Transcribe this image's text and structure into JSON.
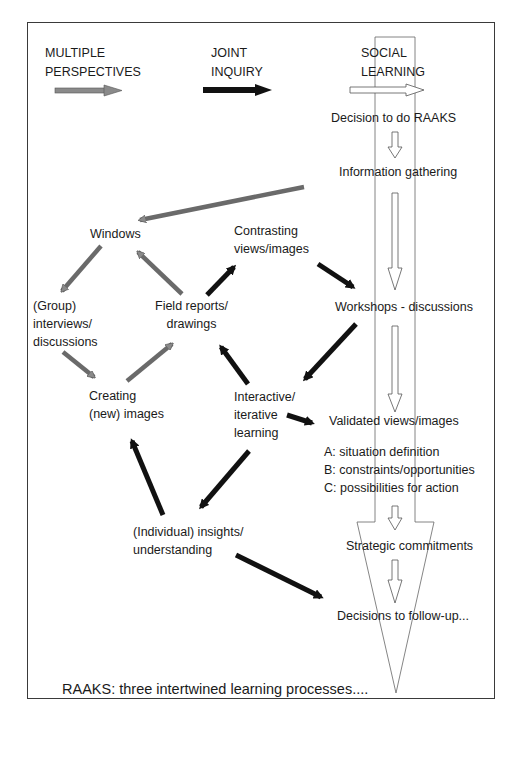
{
  "headers": {
    "multiple": {
      "line1": "MULTIPLE",
      "line2": "PERSPECTIVES"
    },
    "joint": {
      "line1": "JOINT",
      "line2": "INQUIRY"
    },
    "social": {
      "line1": "SOCIAL",
      "line2": "LEARNING"
    }
  },
  "nodes": {
    "windows": "Windows",
    "contrasting": {
      "line1": "Contrasting",
      "line2": "views/images"
    },
    "group": {
      "line1": "(Group)",
      "line2": "interviews/",
      "line3": "discussions"
    },
    "field": {
      "line1": "Field reports/",
      "line2": "drawings"
    },
    "creating": {
      "line1": "Creating",
      "line2": "(new) images"
    },
    "interactive": {
      "line1": "Interactive/",
      "line2": "iterative",
      "line3": "learning"
    },
    "individual": {
      "line1": "(Individual) insights/",
      "line2": "understanding"
    }
  },
  "social_steps": {
    "decision": "Decision to do RAAKS",
    "information": "Information gathering",
    "workshops": "Workshops - discussions",
    "validated": "Validated views/images",
    "a": "A: situation definition",
    "b": "B: constraints/opportunities",
    "c": "C: possibilities for action",
    "strategic": "Strategic commitments",
    "decisions_follow": "Decisions to follow-up..."
  },
  "caption": "RAAKS: three intertwined learning processes....",
  "colors": {
    "gray_arrow": "#8a8a8a",
    "black_arrow": "#111111",
    "outline": "#555555",
    "frame": "#3a3a3a"
  }
}
